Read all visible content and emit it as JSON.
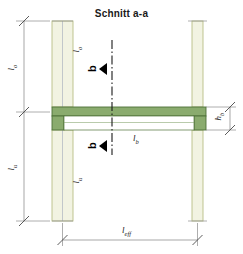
{
  "drawing": {
    "title": "Schnitt a-a",
    "type": "structural-cross-section",
    "colors": {
      "beam_fill": "#8aab6e",
      "beam_edge": "#4d7038",
      "column_fill": "#f2f3e2",
      "column_edge": "#b9bf86",
      "dimension_line": "#555555",
      "center_line": "#1a1a1a",
      "text": "#1a1a1a"
    },
    "labels": {
      "upper_column_dim": "l",
      "upper_column_dim_sub": "o",
      "lower_column_dim": "l",
      "lower_column_dim_sub": "u",
      "upper_column_member": "l",
      "upper_column_member_sub": "o",
      "lower_column_member": "l",
      "lower_column_member_sub": "u",
      "beam_length": "l",
      "beam_length_sub": "b",
      "beam_height": "h",
      "beam_height_sub": "b",
      "effective_span": "l",
      "effective_span_sub": "eff",
      "section_mark_upper": "b",
      "section_mark_lower": "b"
    }
  }
}
